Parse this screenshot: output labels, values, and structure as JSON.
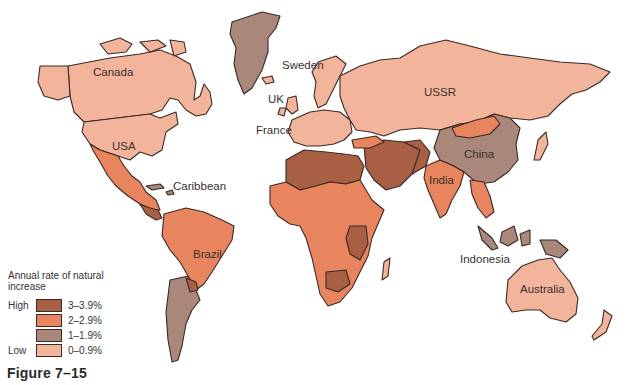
{
  "figure_label": "Figure 7–15",
  "legend": {
    "title": "Annual rate of natural increase",
    "items": [
      {
        "level": "High",
        "range": "3–3.9%",
        "color": "#a85f44"
      },
      {
        "level": "",
        "range": "2–2.9%",
        "color": "#e8855e"
      },
      {
        "level": "",
        "range": "1–1.9%",
        "color": "#a9877a"
      },
      {
        "level": "Low",
        "range": "0–0.9%",
        "color": "#f2b49a"
      }
    ]
  },
  "colors": {
    "c3": "#a85f44",
    "c2": "#e8855e",
    "c1": "#a9877a",
    "c0": "#f2b49a"
  },
  "labels": {
    "canada": "Canada",
    "usa": "USA",
    "caribbean": "Caribbean",
    "brazil": "Brazil",
    "sweden": "Sweden",
    "uk": "UK",
    "france": "France",
    "ussr": "USSR",
    "china": "China",
    "india": "India",
    "indonesia": "Indonesia",
    "australia": "Australia"
  }
}
